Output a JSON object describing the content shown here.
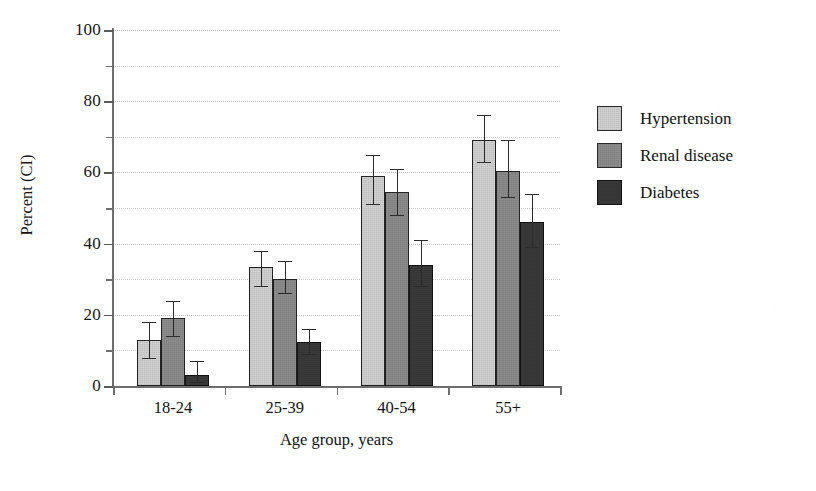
{
  "chart_data": {
    "type": "bar",
    "title": "",
    "xlabel": "Age group, years",
    "ylabel": "Percent (CI)",
    "categories": [
      "18-24",
      "25-39",
      "40-54",
      "55+"
    ],
    "ylim": [
      0,
      100
    ],
    "y_major_ticks": [
      0,
      20,
      40,
      60,
      80,
      100
    ],
    "y_minor_ticks": [
      10,
      30,
      50,
      70,
      90
    ],
    "grid": "horizontal dotted gridlines every 10 units",
    "legend_position": "right",
    "error_bars": "95% confidence interval",
    "series": [
      {
        "name": "Hypertension",
        "color": "#d3d3d3",
        "values": [
          13,
          33.5,
          59,
          69
        ],
        "ci_low": [
          8,
          28,
          51,
          63
        ],
        "ci_high": [
          18,
          38,
          65,
          76
        ]
      },
      {
        "name": "Renal disease",
        "color": "#8d8d8d",
        "values": [
          19,
          30,
          54.5,
          60.5
        ],
        "ci_low": [
          14,
          26,
          48,
          53
        ],
        "ci_high": [
          24,
          35,
          61,
          69
        ]
      },
      {
        "name": "Diabetes",
        "color": "#3a3a3a",
        "values": [
          3,
          12.5,
          34,
          46
        ],
        "ci_low": [
          1,
          9,
          28,
          39
        ],
        "ci_high": [
          7,
          16,
          41,
          54
        ]
      }
    ]
  },
  "axes": {
    "y_tick_labels": [
      "100",
      "80",
      "60",
      "40",
      "20",
      "0"
    ],
    "y_axis_title": "Percent (CI)",
    "x_axis_title": "Age group, years",
    "x_tick_labels": [
      "18-24",
      "25-39",
      "40-54",
      "55+"
    ]
  },
  "legend": {
    "entries": [
      {
        "label": "Hypertension",
        "swatch": "light-gray-swatch"
      },
      {
        "label": "Renal disease",
        "swatch": "medium-gray-swatch"
      },
      {
        "label": "Diabetes",
        "swatch": "dark-gray-swatch"
      }
    ]
  }
}
